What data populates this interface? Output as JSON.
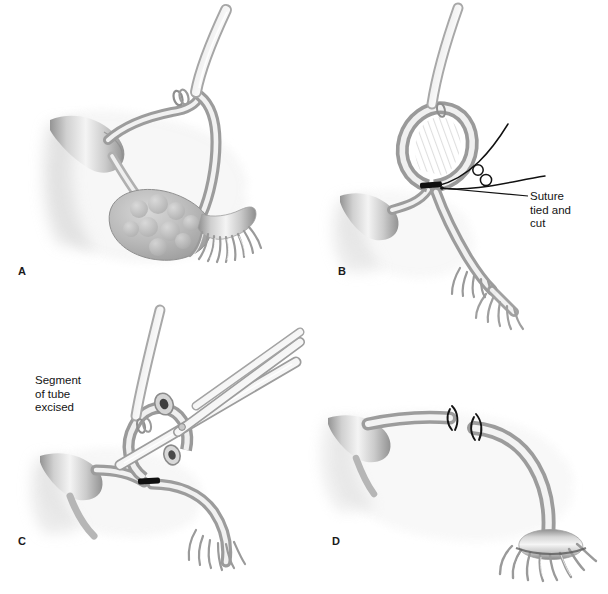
{
  "figure": {
    "background_color": "#ffffff",
    "width": 608,
    "height": 594,
    "style": "grayscale medical line-and-tone illustration",
    "ink_color": "#1a1a1a",
    "tissue_light": "#f2f2f2",
    "tissue_mid": "#c9c9c9",
    "tissue_dark": "#9a9a9a",
    "suture_color": "#111111"
  },
  "panels": [
    {
      "id": "A",
      "label": "A",
      "position": "top-left",
      "caption": "",
      "structures": [
        "forceps grasping fallopian tube",
        "knuckle of fallopian tube elevated",
        "broad ligament / mesosalpinx with hatched shading",
        "ovary (lobulated)",
        "fimbriae",
        "uterine cornu"
      ]
    },
    {
      "id": "B",
      "label": "B",
      "position": "top-right",
      "caption": "Suture tied and cut",
      "caption_lines": [
        "Suture",
        "tied and",
        "cut"
      ],
      "structures": [
        "tubal loop ligated at base",
        "black suture ligature band",
        "suture ends with two knot loops",
        "leader line to ligature",
        "fimbriae",
        "broad ligament with hatched shading"
      ]
    },
    {
      "id": "C",
      "label": "C",
      "position": "bottom-left",
      "caption": "Segment of tube excised",
      "caption_lines": [
        "Segment",
        "of tube",
        "excised"
      ],
      "structures": [
        "scissors with open blades",
        "forceps holding tubal loop",
        "cut tube lumen ends",
        "black suture ligature band",
        "fimbriae",
        "broad ligament with hatched shading"
      ]
    },
    {
      "id": "D",
      "label": "D",
      "position": "bottom-right",
      "caption": "",
      "structures": [
        "proximal tubal stump with ligature knot",
        "distal tubal stump with ligature knot",
        "separated tube ends",
        "mesosalpinx with hatched shading",
        "fimbriated end"
      ]
    }
  ],
  "labels": {
    "panel_a": "A",
    "panel_b": "B",
    "panel_c": "C",
    "panel_d": "D",
    "suture_callout": "Suture\ntied and\ncut",
    "segment_callout": "Segment\nof tube\nexcised"
  }
}
